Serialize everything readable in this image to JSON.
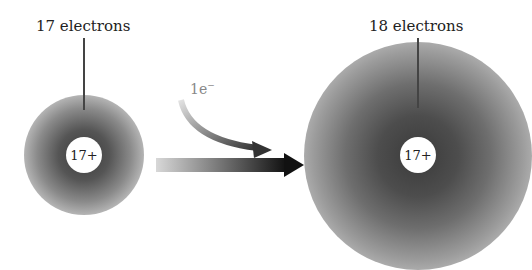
{
  "left_atom": {
    "label": "17 electrons",
    "nucleus_charge": "17+"
  },
  "right_atom": {
    "label": "18 electrons",
    "nucleus_charge": "17+"
  },
  "electron_transfer": {
    "count": "1e",
    "charge_sign": "−"
  },
  "colors": {
    "cloud_dark": "#3a3a3a",
    "arrow_dark": "#111111",
    "arrow_light": "#d8d8d8"
  }
}
